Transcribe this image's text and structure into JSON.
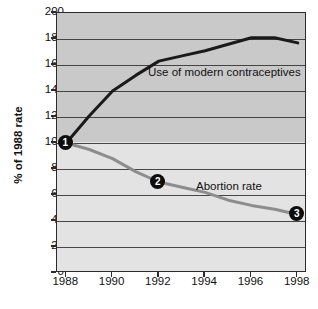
{
  "chart_data": {
    "type": "line",
    "title": "",
    "xlabel": "",
    "ylabel": "% of 1988 rate",
    "xlim": [
      1987.6,
      1998.4
    ],
    "ylim": [
      0,
      200
    ],
    "grid": true,
    "legend_position": "inline-annotation",
    "x_ticks": [
      "1988",
      "1990",
      "1992",
      "1994",
      "1996",
      "1998"
    ],
    "x_tick_values": [
      1988,
      1990,
      1992,
      1994,
      1996,
      1998
    ],
    "y_ticks": [
      "0",
      "20",
      "40",
      "60",
      "80",
      "100",
      "120",
      "140",
      "160",
      "180",
      "200"
    ],
    "y_tick_values": [
      0,
      20,
      40,
      60,
      80,
      100,
      120,
      140,
      160,
      180,
      200
    ],
    "x": [
      1988,
      1989,
      1990,
      1991,
      1992,
      1993,
      1994,
      1995,
      1996,
      1997,
      1998
    ],
    "series": [
      {
        "name": "Use of modern contraceptives",
        "color": "#1a1a1a",
        "values": [
          100,
          121,
          140,
          152,
          163,
          167,
          171,
          176,
          181,
          181,
          177
        ]
      },
      {
        "name": "Abortion rate",
        "color": "#8d8d8d",
        "values": [
          100,
          95,
          88,
          78,
          70,
          66,
          62,
          56,
          52,
          49,
          45
        ]
      }
    ],
    "annotations": [
      {
        "label": "Use of modern contraceptives",
        "series": "Use of modern contraceptives"
      },
      {
        "label": "Abortion rate",
        "series": "Abortion rate"
      }
    ],
    "markers": [
      {
        "label": "1",
        "x": 1988,
        "y": 100
      },
      {
        "label": "2",
        "x": 1992,
        "y": 70
      },
      {
        "label": "3",
        "x": 1998,
        "y": 45
      }
    ],
    "colors": {
      "contraceptives_line": "#1a1a1a",
      "abortion_line": "#8d8d8d",
      "plot_band_upper": "#c9c9c9",
      "plot_band_lower": "#e3e3e3",
      "axis": "#2b2b2b",
      "marker_fill": "#0d0d0d",
      "marker_text": "#ffffff"
    }
  }
}
